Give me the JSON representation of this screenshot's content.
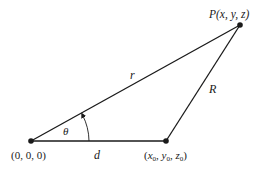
{
  "diagram": {
    "points": {
      "origin": {
        "label": "(0, 0, 0)",
        "x": 31,
        "y": 141
      },
      "source": {
        "label_parts": {
          "x": "x",
          "y": "y",
          "z": "z",
          "sub": "0"
        },
        "x": 166,
        "y": 141
      },
      "field": {
        "label": "P(x, y, z)",
        "x": 240,
        "y": 25
      }
    },
    "segments": {
      "origin_to_field": "r",
      "source_to_field": "R",
      "origin_to_source": "d"
    },
    "angle": {
      "label": "θ"
    },
    "colors": {
      "line": "#1a1a1a",
      "background": "#ffffff"
    }
  }
}
